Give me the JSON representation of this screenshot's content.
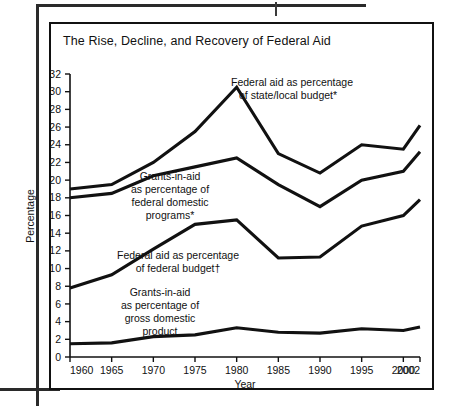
{
  "figure": {
    "title": "The Rise, Decline, and Recovery of Federal Aid"
  },
  "chart_data": {
    "type": "line",
    "title": "The Rise, Decline, and Recovery of Federal Aid",
    "xlabel": "Year",
    "ylabel": "Percentage",
    "x": [
      1960,
      1965,
      1970,
      1975,
      1980,
      1985,
      1990,
      1995,
      2000,
      2002
    ],
    "xtick_labels": [
      "1960",
      "1965",
      "1970",
      "1975",
      "1980",
      "1985",
      "1990",
      "1995",
      "2000",
      "2002"
    ],
    "ytick_labels": [
      "0",
      "2",
      "4",
      "6",
      "8",
      "10",
      "12",
      "14",
      "16",
      "18",
      "20",
      "22",
      "24",
      "26",
      "28",
      "30",
      "32"
    ],
    "yticks": [
      0,
      2,
      4,
      6,
      8,
      10,
      12,
      14,
      16,
      18,
      20,
      22,
      24,
      26,
      28,
      30,
      32
    ],
    "ylim": [
      0,
      32
    ],
    "xlim": [
      1960,
      2002
    ],
    "grid": false,
    "legend_position": "inline-annotations",
    "line_color": "#111111",
    "series": [
      {
        "name": "Federal aid as percentage of state/local budget*",
        "label_line1": "Federal aid as percentage",
        "label_line2": "of state/local budget*",
        "values": [
          19.0,
          19.5,
          22.0,
          25.5,
          30.5,
          23.0,
          20.8,
          24.0,
          23.5,
          26.2
        ]
      },
      {
        "name": "Grants-in-aid as percentage of federal domestic programs*",
        "label_line1": "Grants-in-aid",
        "label_line2": "as percentage of",
        "label_line3": "federal domestic",
        "label_line4": "programs*",
        "values": [
          18.0,
          18.5,
          20.5,
          21.5,
          22.5,
          19.5,
          17.0,
          20.0,
          21.0,
          23.2
        ]
      },
      {
        "name": "Federal aid as percentage of federal budget†",
        "label_line1": "Federal aid as percentage",
        "label_line2": "of federal budget†",
        "values": [
          7.8,
          9.3,
          12.2,
          15.0,
          15.5,
          11.2,
          11.3,
          14.8,
          16.0,
          17.8
        ]
      },
      {
        "name": "Grants-in-aid as percentage of gross domestic product",
        "label_line1": "Grants-in-aid",
        "label_line2": "as percentage of",
        "label_line3": "gross domestic",
        "label_line4": "product",
        "values": [
          1.5,
          1.6,
          2.3,
          2.5,
          3.3,
          2.8,
          2.7,
          3.2,
          3.0,
          3.4
        ]
      }
    ]
  }
}
